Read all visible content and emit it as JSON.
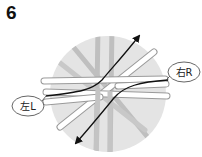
{
  "step": {
    "number": "6"
  },
  "labels": {
    "right": "右R",
    "left": "左L"
  },
  "colors": {
    "disc": "#e4e4e4",
    "gray_strip": "#bfbfbf",
    "white_strip": "#ffffff",
    "strip_outline": "#9a9a9a",
    "arrow": "#111111"
  },
  "arrows": [
    {
      "name": "left-to-upper-right",
      "direction": "up-right"
    },
    {
      "name": "right-to-lower-left",
      "direction": "down-left"
    }
  ]
}
